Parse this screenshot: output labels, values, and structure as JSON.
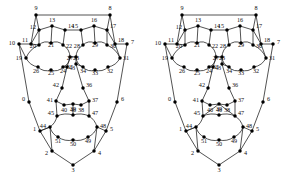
{
  "figure": {
    "type": "graph-diagram-pair",
    "background_color": "#ffffff",
    "ink_color": "#1a1a1a",
    "node_color": "#000000",
    "label_color": "#111111",
    "node_count_per_graph": 52,
    "node_id_range": "0-51",
    "panel_count": 2
  },
  "panels": [
    {
      "name": "left-graph",
      "offset_x": 0,
      "variant": "plain-center"
    },
    {
      "name": "right-graph",
      "offset_x": 146,
      "variant": "braced-center"
    }
  ],
  "nodes": [
    {
      "id": "0",
      "x": 29,
      "y": 102,
      "lx": 25,
      "ly": 101,
      "anchor": "end"
    },
    {
      "id": "1",
      "x": 40,
      "y": 131,
      "lx": 36,
      "ly": 131,
      "anchor": "end"
    },
    {
      "id": "2",
      "x": 52,
      "y": 151,
      "lx": 48,
      "ly": 155,
      "anchor": "end"
    },
    {
      "id": "3",
      "x": 73,
      "y": 165,
      "lx": 73,
      "ly": 172,
      "anchor": "middle"
    },
    {
      "id": "4",
      "x": 94,
      "y": 151,
      "lx": 98,
      "ly": 155,
      "anchor": "start"
    },
    {
      "id": "5",
      "x": 106,
      "y": 131,
      "lx": 110,
      "ly": 131,
      "anchor": "start"
    },
    {
      "id": "6",
      "x": 117,
      "y": 102,
      "lx": 121,
      "ly": 101,
      "anchor": "start"
    },
    {
      "id": "7",
      "x": 127,
      "y": 44,
      "lx": 131,
      "ly": 44,
      "anchor": "start"
    },
    {
      "id": "8",
      "x": 110,
      "y": 15,
      "lx": 110,
      "ly": 10,
      "anchor": "middle"
    },
    {
      "id": "9",
      "x": 36,
      "y": 15,
      "lx": 36,
      "ly": 10,
      "anchor": "middle"
    },
    {
      "id": "10",
      "x": 19,
      "y": 44,
      "lx": 15,
      "ly": 45,
      "anchor": "end"
    },
    {
      "id": "11",
      "x": 31,
      "y": 44,
      "lx": 28,
      "ly": 42,
      "anchor": "end"
    },
    {
      "id": "12",
      "x": 39,
      "y": 30,
      "lx": 36,
      "ly": 29,
      "anchor": "end"
    },
    {
      "id": "13",
      "x": 52,
      "y": 26,
      "lx": 52,
      "ly": 22,
      "anchor": "middle"
    },
    {
      "id": "14",
      "x": 65,
      "y": 30,
      "lx": 68,
      "ly": 28,
      "anchor": "start"
    },
    {
      "id": "15",
      "x": 81,
      "y": 30,
      "lx": 78,
      "ly": 28,
      "anchor": "end"
    },
    {
      "id": "16",
      "x": 94,
      "y": 26,
      "lx": 94,
      "ly": 22,
      "anchor": "middle"
    },
    {
      "id": "17",
      "x": 107,
      "y": 30,
      "lx": 110,
      "ly": 28,
      "anchor": "start"
    },
    {
      "id": "18",
      "x": 115,
      "y": 44,
      "lx": 118,
      "ly": 42,
      "anchor": "start"
    },
    {
      "id": "19",
      "x": 26,
      "y": 58,
      "lx": 22,
      "ly": 60,
      "anchor": "end"
    },
    {
      "id": "20",
      "x": 39,
      "y": 45,
      "lx": 36,
      "ly": 48,
      "anchor": "end"
    },
    {
      "id": "21",
      "x": 51,
      "y": 43,
      "lx": 51,
      "ly": 47,
      "anchor": "middle"
    },
    {
      "id": "22",
      "x": 63,
      "y": 45,
      "lx": 66,
      "ly": 48,
      "anchor": "start"
    },
    {
      "id": "23",
      "x": 70,
      "y": 57,
      "lx": 73,
      "ly": 60,
      "anchor": "start"
    },
    {
      "id": "24",
      "x": 63,
      "y": 67,
      "lx": 63,
      "ly": 73,
      "anchor": "middle"
    },
    {
      "id": "25",
      "x": 51,
      "y": 70,
      "lx": 51,
      "ly": 75,
      "anchor": "middle"
    },
    {
      "id": "26",
      "x": 38,
      "y": 67,
      "lx": 36,
      "ly": 73,
      "anchor": "middle"
    },
    {
      "id": "27",
      "x": 76,
      "y": 57,
      "lx": 73,
      "ly": 60,
      "anchor": "end"
    },
    {
      "id": "28",
      "x": 83,
      "y": 45,
      "lx": 80,
      "ly": 48,
      "anchor": "end"
    },
    {
      "id": "29",
      "x": 95,
      "y": 43,
      "lx": 95,
      "ly": 47,
      "anchor": "middle"
    },
    {
      "id": "30",
      "x": 107,
      "y": 45,
      "lx": 110,
      "ly": 48,
      "anchor": "start"
    },
    {
      "id": "31",
      "x": 120,
      "y": 58,
      "lx": 123,
      "ly": 60,
      "anchor": "start"
    },
    {
      "id": "32",
      "x": 108,
      "y": 67,
      "lx": 110,
      "ly": 73,
      "anchor": "middle"
    },
    {
      "id": "33",
      "x": 95,
      "y": 70,
      "lx": 95,
      "ly": 75,
      "anchor": "middle"
    },
    {
      "id": "34",
      "x": 83,
      "y": 67,
      "lx": 83,
      "ly": 73,
      "anchor": "middle"
    },
    {
      "id": "35",
      "x": 76,
      "y": 64,
      "lx": 73,
      "ly": 69,
      "anchor": "end"
    },
    {
      "id": "36",
      "x": 83,
      "y": 88,
      "lx": 86,
      "ly": 87,
      "anchor": "start"
    },
    {
      "id": "37",
      "x": 89,
      "y": 101,
      "lx": 92,
      "ly": 102,
      "anchor": "start"
    },
    {
      "id": "38",
      "x": 81,
      "y": 105,
      "lx": 81,
      "ly": 112,
      "anchor": "middle"
    },
    {
      "id": "39",
      "x": 73,
      "y": 104,
      "lx": 73,
      "ly": 111,
      "anchor": "middle"
    },
    {
      "id": "40",
      "x": 64,
      "y": 105,
      "lx": 64,
      "ly": 112,
      "anchor": "middle"
    },
    {
      "id": "41",
      "x": 56,
      "y": 101,
      "lx": 53,
      "ly": 102,
      "anchor": "end"
    },
    {
      "id": "42",
      "x": 62,
      "y": 88,
      "lx": 59,
      "ly": 87,
      "anchor": "end"
    },
    {
      "id": "43",
      "x": 67,
      "y": 67,
      "lx": 69,
      "ly": 70,
      "anchor": "start"
    },
    {
      "id": "44",
      "x": 50,
      "y": 127,
      "lx": 46,
      "ly": 128,
      "anchor": "end"
    },
    {
      "id": "45",
      "x": 57,
      "y": 116,
      "lx": 54,
      "ly": 115,
      "anchor": "end"
    },
    {
      "id": "46",
      "x": 73,
      "y": 115,
      "lx": 73,
      "ly": 112,
      "anchor": "middle"
    },
    {
      "id": "47",
      "x": 89,
      "y": 116,
      "lx": 92,
      "ly": 115,
      "anchor": "start"
    },
    {
      "id": "48",
      "x": 97,
      "y": 127,
      "lx": 100,
      "ly": 128,
      "anchor": "start"
    },
    {
      "id": "49",
      "x": 88,
      "y": 137,
      "lx": 88,
      "ly": 143,
      "anchor": "middle"
    },
    {
      "id": "50",
      "x": 73,
      "y": 140,
      "lx": 73,
      "ly": 146,
      "anchor": "middle"
    },
    {
      "id": "51",
      "x": 58,
      "y": 137,
      "lx": 58,
      "ly": 143,
      "anchor": "middle"
    }
  ],
  "edges_common": [
    [
      "9",
      "8"
    ],
    [
      "9",
      "12"
    ],
    [
      "9",
      "11"
    ],
    [
      "8",
      "17"
    ],
    [
      "8",
      "18"
    ],
    [
      "10",
      "11"
    ],
    [
      "10",
      "0"
    ],
    [
      "18",
      "7"
    ],
    [
      "7",
      "6"
    ],
    [
      "0",
      "1"
    ],
    [
      "1",
      "2"
    ],
    [
      "2",
      "3"
    ],
    [
      "3",
      "4"
    ],
    [
      "4",
      "5"
    ],
    [
      "5",
      "6"
    ],
    [
      "11",
      "12"
    ],
    [
      "12",
      "13"
    ],
    [
      "13",
      "14"
    ],
    [
      "14",
      "15"
    ],
    [
      "15",
      "16"
    ],
    [
      "16",
      "17"
    ],
    [
      "17",
      "18"
    ],
    [
      "11",
      "20"
    ],
    [
      "12",
      "20"
    ],
    [
      "13",
      "21"
    ],
    [
      "14",
      "22"
    ],
    [
      "15",
      "28"
    ],
    [
      "16",
      "29"
    ],
    [
      "17",
      "30"
    ],
    [
      "18",
      "31"
    ],
    [
      "20",
      "21"
    ],
    [
      "21",
      "22"
    ],
    [
      "22",
      "23"
    ],
    [
      "19",
      "20"
    ],
    [
      "10",
      "19"
    ],
    [
      "28",
      "29"
    ],
    [
      "29",
      "30"
    ],
    [
      "27",
      "28"
    ],
    [
      "30",
      "31"
    ],
    [
      "19",
      "26"
    ],
    [
      "26",
      "25"
    ],
    [
      "25",
      "24"
    ],
    [
      "24",
      "23"
    ],
    [
      "27",
      "34"
    ],
    [
      "34",
      "33"
    ],
    [
      "33",
      "32"
    ],
    [
      "32",
      "31"
    ],
    [
      "23",
      "43"
    ],
    [
      "24",
      "43"
    ],
    [
      "27",
      "35"
    ],
    [
      "35",
      "34"
    ],
    [
      "23",
      "27"
    ],
    [
      "43",
      "42"
    ],
    [
      "35",
      "36"
    ],
    [
      "42",
      "41"
    ],
    [
      "36",
      "37"
    ],
    [
      "41",
      "40"
    ],
    [
      "40",
      "39"
    ],
    [
      "39",
      "38"
    ],
    [
      "38",
      "37"
    ],
    [
      "41",
      "45"
    ],
    [
      "37",
      "47"
    ],
    [
      "45",
      "46"
    ],
    [
      "46",
      "47"
    ],
    [
      "45",
      "44"
    ],
    [
      "47",
      "48"
    ],
    [
      "44",
      "51"
    ],
    [
      "51",
      "50"
    ],
    [
      "50",
      "49"
    ],
    [
      "49",
      "48"
    ],
    [
      "44",
      "1"
    ],
    [
      "48",
      "5"
    ],
    [
      "1",
      "44"
    ],
    [
      "2",
      "44"
    ],
    [
      "4",
      "48"
    ]
  ],
  "edges_left_only": [
    [
      "39",
      "46"
    ]
  ],
  "edges_right_only": [
    [
      "39",
      "45"
    ],
    [
      "39",
      "47"
    ]
  ]
}
